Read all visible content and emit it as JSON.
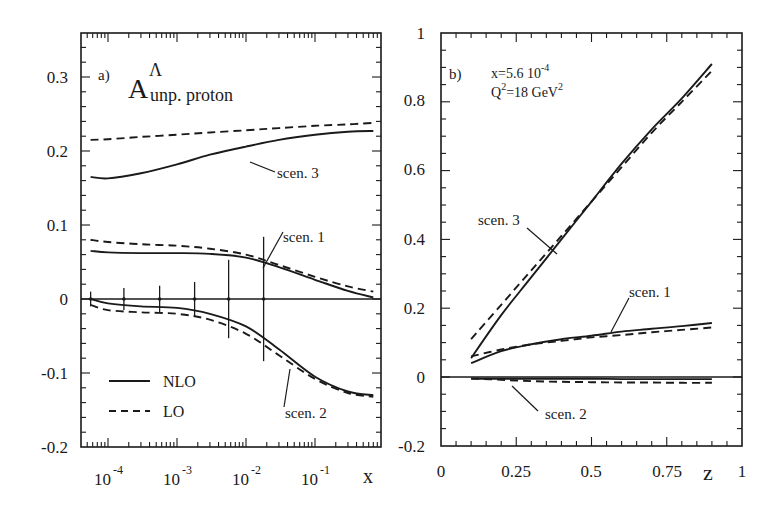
{
  "chart_data": [
    {
      "type": "line",
      "panel_label": "a)",
      "title": "A^Λ unp. proton",
      "title_main": "A",
      "title_super": "Λ",
      "title_sub": "unp. proton",
      "xlabel": "x",
      "ylabel": "",
      "xscale": "log",
      "xlim": [
        4e-05,
        1
      ],
      "ylim": [
        -0.2,
        0.36
      ],
      "xticks": [
        "10^-4",
        "10^-3",
        "10^-2",
        "10^-1"
      ],
      "xtick_labels": [
        {
          "base": "10",
          "exp": "-4"
        },
        {
          "base": "10",
          "exp": "-3"
        },
        {
          "base": "10",
          "exp": "-2"
        },
        {
          "base": "10",
          "exp": "-1"
        }
      ],
      "yticks": [
        "0.3",
        "0.2",
        "0.1",
        "0",
        "-0.1",
        "-0.2"
      ],
      "grid": false,
      "legend": {
        "position": "lower left",
        "entries": [
          {
            "label": "NLO",
            "style": "solid"
          },
          {
            "label": "LO",
            "style": "dashed"
          }
        ]
      },
      "x": [
        5.6e-05,
        0.0001,
        0.0003,
        0.001,
        0.003,
        0.01,
        0.03,
        0.1,
        0.3,
        0.7
      ],
      "series": [
        {
          "name": "scen. 3 NLO",
          "style": "solid",
          "values": [
            0.165,
            0.163,
            0.17,
            0.182,
            0.195,
            0.206,
            0.215,
            0.222,
            0.226,
            0.227
          ]
        },
        {
          "name": "scen. 3 LO",
          "style": "dashed",
          "values": [
            0.215,
            0.216,
            0.219,
            0.222,
            0.225,
            0.228,
            0.231,
            0.234,
            0.236,
            0.238
          ]
        },
        {
          "name": "scen. 1 NLO",
          "style": "solid",
          "values": [
            0.065,
            0.063,
            0.062,
            0.062,
            0.061,
            0.056,
            0.043,
            0.026,
            0.011,
            0.002
          ]
        },
        {
          "name": "scen. 1 LO",
          "style": "dashed",
          "values": [
            0.08,
            0.077,
            0.074,
            0.072,
            0.068,
            0.06,
            0.046,
            0.03,
            0.017,
            0.01
          ]
        },
        {
          "name": "scen. 2 NLO",
          "style": "solid",
          "values": [
            0.0,
            -0.006,
            -0.01,
            -0.012,
            -0.02,
            -0.037,
            -0.068,
            -0.105,
            -0.125,
            -0.13
          ]
        },
        {
          "name": "scen. 2 LO",
          "style": "dashed",
          "values": [
            -0.008,
            -0.015,
            -0.018,
            -0.02,
            -0.028,
            -0.047,
            -0.076,
            -0.108,
            -0.127,
            -0.132
          ]
        }
      ],
      "error_bars": [
        {
          "x": 5.6e-05,
          "y": 0,
          "err": 0.01
        },
        {
          "x": 0.00017,
          "y": 0,
          "err": 0.015
        },
        {
          "x": 0.00056,
          "y": 0,
          "err": 0.018
        },
        {
          "x": 0.0018,
          "y": 0,
          "err": 0.023
        },
        {
          "x": 0.0056,
          "y": 0,
          "err": 0.053
        },
        {
          "x": 0.018,
          "y": 0,
          "err": 0.084
        }
      ],
      "annotations": [
        "scen. 3",
        "scen. 1",
        "scen. 2"
      ]
    },
    {
      "type": "line",
      "panel_label": "b)",
      "title": "",
      "annotation_lines": [
        "x=5.6 10^-4",
        "Q^2=18 GeV^2"
      ],
      "xlabel": "z",
      "ylabel": "",
      "xlim": [
        0,
        1
      ],
      "ylim": [
        -0.2,
        1
      ],
      "xticks": [
        "0",
        "0.25",
        "0.5",
        "0.75",
        "1"
      ],
      "yticks": [
        "1",
        "0.8",
        "0.6",
        "0.4",
        "0.2",
        "0",
        "-0.2"
      ],
      "grid": false,
      "x": [
        0.1,
        0.2,
        0.3,
        0.4,
        0.5,
        0.6,
        0.7,
        0.8,
        0.9
      ],
      "series": [
        {
          "name": "scen. 3 NLO",
          "style": "solid",
          "values": [
            0.055,
            0.18,
            0.29,
            0.4,
            0.51,
            0.62,
            0.72,
            0.81,
            0.91
          ]
        },
        {
          "name": "scen. 3 LO",
          "style": "dashed",
          "values": [
            0.11,
            0.21,
            0.31,
            0.41,
            0.51,
            0.61,
            0.71,
            0.8,
            0.89
          ]
        },
        {
          "name": "scen. 1 NLO",
          "style": "solid",
          "values": [
            0.04,
            0.075,
            0.095,
            0.11,
            0.12,
            0.132,
            0.14,
            0.148,
            0.157
          ]
        },
        {
          "name": "scen. 1 LO",
          "style": "dashed",
          "values": [
            0.06,
            0.08,
            0.095,
            0.105,
            0.115,
            0.122,
            0.13,
            0.137,
            0.144
          ]
        },
        {
          "name": "scen. 2 NLO",
          "style": "solid",
          "values": [
            -0.005,
            -0.005,
            -0.005,
            -0.005,
            -0.005,
            -0.006,
            -0.006,
            -0.006,
            -0.006
          ]
        },
        {
          "name": "scen. 2 LO",
          "style": "dashed",
          "values": [
            -0.004,
            -0.008,
            -0.012,
            -0.014,
            -0.015,
            -0.016,
            -0.016,
            -0.017,
            -0.017
          ]
        }
      ],
      "annotations": [
        "scen. 3",
        "scen. 1",
        "scen. 2"
      ]
    }
  ],
  "panel_a": {
    "label": "a)",
    "title_main": "A",
    "title_super": "Λ",
    "title_sub": "unp. proton",
    "yticks": [
      "0.3",
      "0.2",
      "0.1",
      "0",
      "-0.1",
      "-0.2"
    ],
    "xticks_base": [
      "10",
      "10",
      "10",
      "10"
    ],
    "xticks_exp": [
      "-4",
      "-3",
      "-2",
      "-1"
    ],
    "xlabel": "x",
    "legend_nlo": "NLO",
    "legend_lo": "LO",
    "ann_scen3": "scen. 3",
    "ann_scen1": "scen. 1",
    "ann_scen2": "scen. 2"
  },
  "panel_b": {
    "label": "b)",
    "info_x_prefix": "x=5.6 10",
    "info_x_exp": "-4",
    "info_q_pre": "Q",
    "info_q_exp": "2",
    "info_q_mid": "=18 GeV",
    "info_q_exp2": "2",
    "yticks": [
      "1",
      "0.8",
      "0.6",
      "0.4",
      "0.2",
      "0",
      "-0.2"
    ],
    "xticks": [
      "0",
      "0.25",
      "0.5",
      "0.75",
      "1"
    ],
    "xlabel": "z",
    "ann_scen3": "scen. 3",
    "ann_scen1": "scen. 1",
    "ann_scen2": "scen. 2"
  },
  "colors": {
    "ink": "#1a1a1a",
    "background": "#ffffff"
  }
}
